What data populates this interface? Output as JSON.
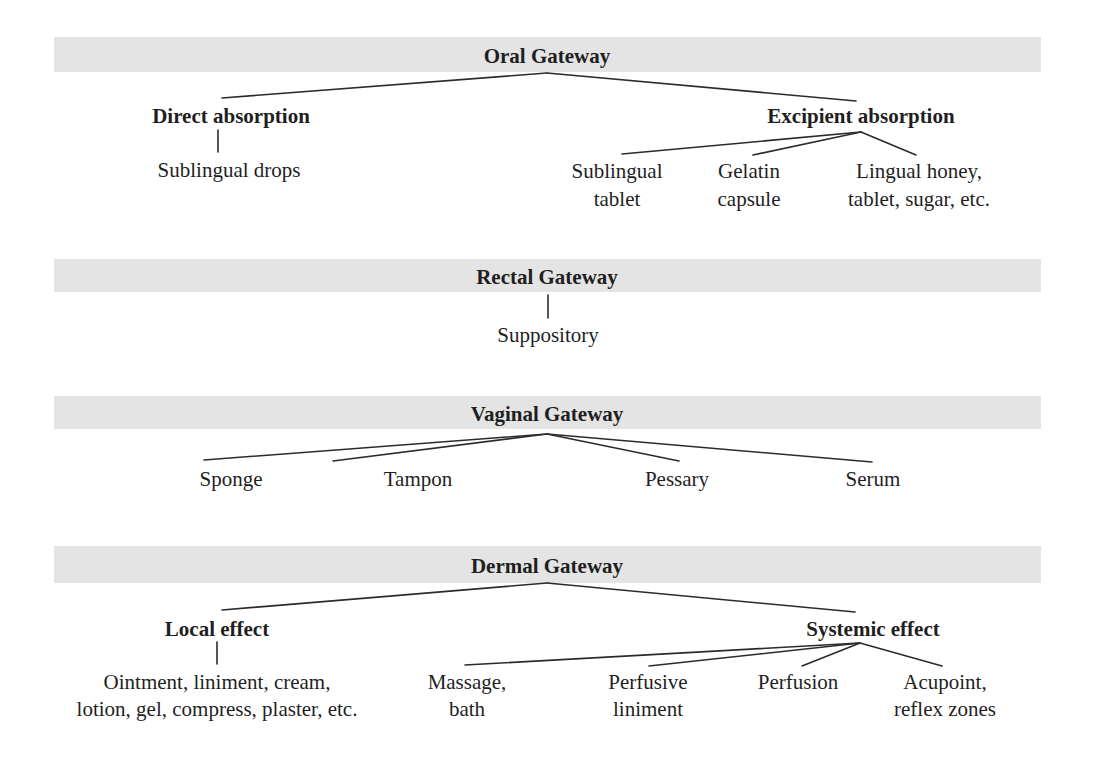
{
  "colors": {
    "bar": "#e4e4e4",
    "line": "#2b2b2b",
    "text": "#1f1f1f"
  },
  "oral": {
    "title": "Oral Gateway",
    "direct": {
      "label": "Direct absorption",
      "items": [
        "Sublingual drops"
      ]
    },
    "excipient": {
      "label": "Excipient absorption",
      "items": [
        [
          "Sublingual",
          "tablet"
        ],
        [
          "Gelatin",
          "capsule"
        ],
        [
          "Lingual honey,",
          "tablet, sugar, etc."
        ]
      ]
    }
  },
  "rectal": {
    "title": "Rectal Gateway",
    "items": [
      "Suppository"
    ]
  },
  "vaginal": {
    "title": "Vaginal Gateway",
    "items": [
      "Sponge",
      "Tampon",
      "Pessary",
      "Serum"
    ]
  },
  "dermal": {
    "title": "Dermal Gateway",
    "local": {
      "label": "Local effect",
      "items": [
        [
          "Ointment, liniment, cream,",
          "lotion, gel, compress, plaster, etc."
        ]
      ]
    },
    "systemic": {
      "label": "Systemic effect",
      "items": [
        [
          "Massage,",
          "bath"
        ],
        [
          "Perfusive",
          "liniment"
        ],
        [
          "Perfusion"
        ],
        [
          "Acupoint,",
          "reflex zones"
        ]
      ]
    }
  }
}
